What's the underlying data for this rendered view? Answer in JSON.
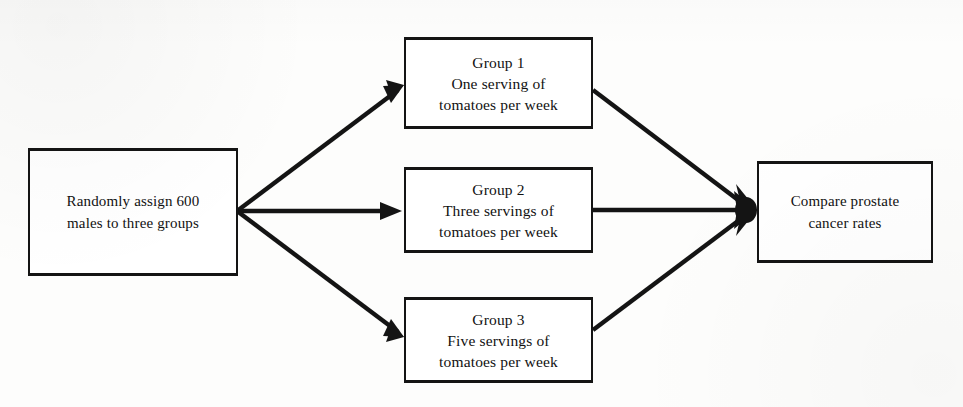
{
  "diagram": {
    "background_color": "#fdfdfc",
    "line_color": "#141414",
    "box_border_color": "#141414",
    "box_fill_color": "#ffffff",
    "nodes": {
      "source": {
        "label": "Randomly assign 600\nmales to three groups",
        "line_1": "Randomly assign 600",
        "line_2": "males to three groups"
      },
      "group_1": {
        "label": "Group 1\nOne serving of\ntomatoes per week",
        "line_1": "Group 1",
        "line_2": "One serving of",
        "line_3": "tomatoes per week"
      },
      "group_2": {
        "label": "Group 2\nThree servings of\ntomatoes per week",
        "line_1": "Group 2",
        "line_2": "Three servings of",
        "line_3": "tomatoes per week"
      },
      "group_3": {
        "label": "Group 3\nFive servings of\ntomatoes per week",
        "line_1": "Group 3",
        "line_2": "Five servings of",
        "line_3": "tomatoes per week"
      },
      "outcome": {
        "label": "Compare prostate\ncancer rates",
        "line_1": "Compare prostate",
        "line_2": "cancer rates"
      }
    },
    "connectors": [
      {
        "name": "source-to-group-1",
        "from": "source",
        "to": "group_1",
        "arrowhead": "at-target"
      },
      {
        "name": "source-to-group-2",
        "from": "source",
        "to": "group_2",
        "arrowhead": "at-target"
      },
      {
        "name": "source-to-group-3",
        "from": "source",
        "to": "group_3",
        "arrowhead": "at-target"
      },
      {
        "name": "group-1-to-outcome",
        "from": "group_1",
        "to": "outcome",
        "arrowhead": "at-target"
      },
      {
        "name": "group-2-to-outcome",
        "from": "group_2",
        "to": "outcome",
        "arrowhead": "at-target"
      },
      {
        "name": "group-3-to-outcome",
        "from": "group_3",
        "to": "outcome",
        "arrowhead": "at-target"
      }
    ]
  }
}
